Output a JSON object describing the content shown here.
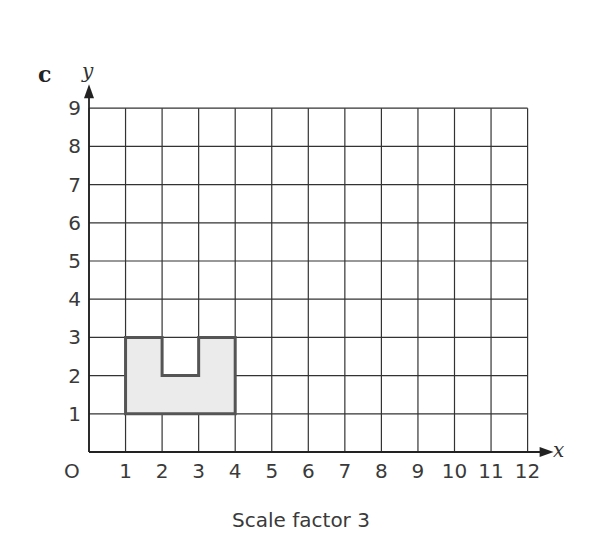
{
  "part_label": "c",
  "caption": "Scale factor 3",
  "axes": {
    "x_label": "x",
    "y_label": "y",
    "origin_label": "O",
    "x_ticks": [
      "1",
      "2",
      "3",
      "4",
      "5",
      "6",
      "7",
      "8",
      "9",
      "10",
      "11",
      "12"
    ],
    "y_ticks": [
      "1",
      "2",
      "3",
      "4",
      "5",
      "6",
      "7",
      "8",
      "9"
    ],
    "x_range": [
      0,
      12
    ],
    "y_range": [
      0,
      9
    ]
  },
  "shape": {
    "vertices": [
      [
        1,
        1
      ],
      [
        4,
        1
      ],
      [
        4,
        3
      ],
      [
        3,
        3
      ],
      [
        3,
        2
      ],
      [
        2,
        2
      ],
      [
        2,
        3
      ],
      [
        1,
        3
      ]
    ],
    "fill": "#ebebeb",
    "stroke": "#555555"
  },
  "scale_factor": 3,
  "colors": {
    "grid": "#333333",
    "shape_fill": "#ebebeb",
    "shape_stroke": "#555555"
  }
}
